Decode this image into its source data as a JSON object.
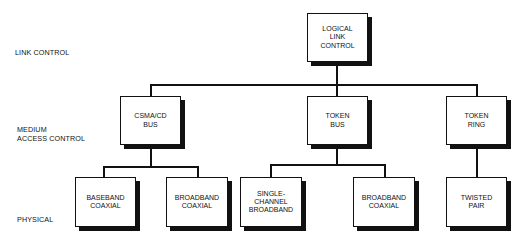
{
  "layers": {
    "link_control": "LINK CONTROL",
    "medium_access_control": "MEDIUM\nACCESS CONTROL",
    "physical": "PHYSICAL"
  },
  "nodes": {
    "llc": "LOGICAL\nLINK\nCONTROL",
    "csma_cd_bus": "CSMA/CD\nBUS",
    "token_bus": "TOKEN\nBUS",
    "token_ring": "TOKEN\nRING",
    "baseband_coaxial": "BASEBAND\nCOAXIAL",
    "broadband_coaxial_1": "BROADBAND\nCOAXIAL",
    "single_channel_broadband": "SINGLE-\nCHANNEL\nBROADBAND",
    "broadband_coaxial_2": "BROADBAND\nCOAXIAL",
    "twisted_pair": "TWISTED\nPAIR"
  },
  "colors": {
    "line": "#111111",
    "background": "#ffffff"
  }
}
